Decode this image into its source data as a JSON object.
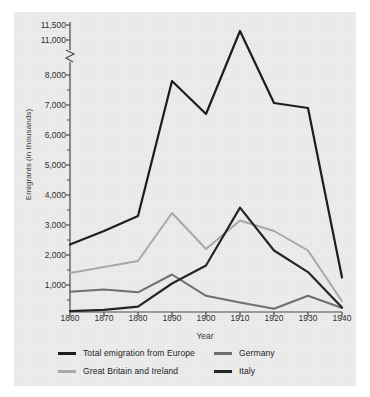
{
  "chart_data": {
    "type": "line",
    "title": "",
    "xlabel": "Year",
    "ylabel": "Emigrants (in thousands)",
    "x": [
      1860,
      1870,
      1880,
      1890,
      1900,
      1910,
      1920,
      1930,
      1940
    ],
    "xtick_labels": [
      "1860",
      "1870",
      "1880",
      "1890",
      "1900",
      "1910",
      "1920",
      "1930",
      "1940"
    ],
    "ytick_labels": [
      "1,000",
      "2,000",
      "3,000",
      "4,000",
      "5,000",
      "6,000",
      "7,000",
      "8,000",
      "11,000",
      "11,500"
    ],
    "ytick_values": [
      1000,
      2000,
      3000,
      4000,
      5000,
      6000,
      7000,
      8000,
      11000,
      11500
    ],
    "yaxis_break": true,
    "yaxis_break_between": [
      8000,
      11000
    ],
    "ylim": [
      0,
      11500
    ],
    "grid": false,
    "legend_position": "bottom",
    "series": [
      {
        "name": "Total emigration from Europe",
        "color": "#1d1d1d",
        "values": [
          2350,
          2800,
          3300,
          7800,
          6700,
          11300,
          8900,
          6900,
          1250
        ]
      },
      {
        "name": "Great Britain and Ireland",
        "color": "#a8a8a8",
        "values": [
          1400,
          1600,
          1800,
          3400,
          2200,
          3150,
          2800,
          2150,
          400
        ]
      },
      {
        "name": "Germany",
        "color": "#6f6f6f",
        "values": [
          750,
          830,
          730,
          1350,
          600,
          350,
          120,
          600,
          150
        ]
      },
      {
        "name": "Italy",
        "color": "#262626",
        "values": [
          30,
          80,
          200,
          1050,
          1650,
          3580,
          2150,
          1430,
          170
        ]
      }
    ]
  },
  "legend": {
    "items": [
      {
        "label": "Total emigration from Europe",
        "color": "#1d1d1d"
      },
      {
        "label": "Germany",
        "color": "#6f6f6f"
      },
      {
        "label": "Great Britain and Ireland",
        "color": "#a8a8a8"
      },
      {
        "label": "Italy",
        "color": "#262626"
      }
    ]
  },
  "colors": {
    "panel_background": "#ececed",
    "axis": "#4a4a4a",
    "text": "#2f2f2f"
  }
}
